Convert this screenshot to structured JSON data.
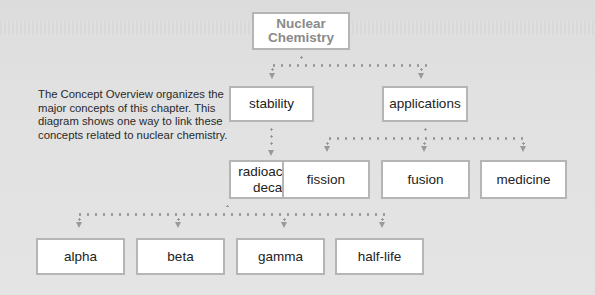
{
  "diagram": {
    "root": {
      "label": "Nuclear Chemistry",
      "line1": "Nuclear",
      "line2": "Chemistry"
    },
    "description": "The Concept Overview organizes the major concepts of this chapter. This diagram shows one way to link these concepts related to nuclear chemistry.",
    "level1": [
      {
        "label": "stability"
      },
      {
        "label": "applications"
      }
    ],
    "stability_children": [
      {
        "label": "radioactive decay"
      }
    ],
    "applications_children": [
      {
        "label": "fission"
      },
      {
        "label": "fusion"
      },
      {
        "label": "medicine"
      }
    ],
    "decay_children": [
      {
        "label": "alpha"
      },
      {
        "label": "beta"
      },
      {
        "label": "gamma"
      },
      {
        "label": "half-life"
      }
    ],
    "colors": {
      "background": "#e0e0e0",
      "box_fill": "#ffffff",
      "box_border": "#b5b5b5",
      "connector": "#999999",
      "root_text": "#8a8a8a"
    }
  }
}
